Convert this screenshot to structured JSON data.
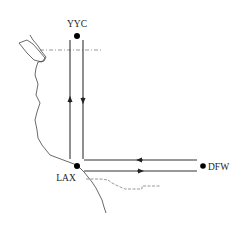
{
  "diagram": {
    "type": "route-map",
    "airports": [
      {
        "code": "YYC",
        "x": 77,
        "y": 36
      },
      {
        "code": "LAX",
        "x": 77,
        "y": 166
      },
      {
        "code": "DFW",
        "x": 203,
        "y": 166
      }
    ],
    "routes": [
      {
        "from": "LAX",
        "to": "YYC",
        "direction": "up"
      },
      {
        "from": "YYC",
        "to": "LAX",
        "direction": "down"
      },
      {
        "from": "DFW",
        "to": "LAX",
        "direction": "left"
      },
      {
        "from": "LAX",
        "to": "DFW",
        "direction": "right"
      }
    ],
    "labels": {
      "yyc": "YYC",
      "lax": "LAX",
      "dfw": "DFW"
    },
    "colors": {
      "line": "#333333",
      "dot": "#000000",
      "background": "#ffffff"
    }
  }
}
